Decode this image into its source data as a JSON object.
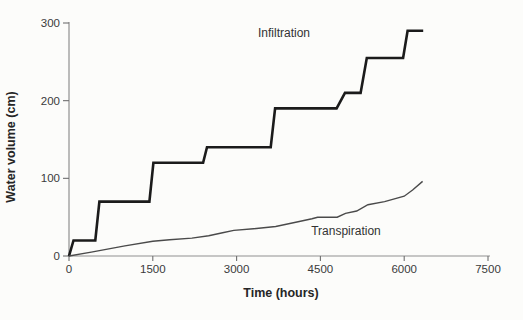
{
  "chart_data": {
    "type": "line",
    "title": "",
    "xlabel": "Time (hours)",
    "ylabel": "Water volume (cm)",
    "xlim": [
      0,
      7500
    ],
    "ylim": [
      0,
      300
    ],
    "x_ticks": [
      0,
      1500,
      3000,
      4500,
      6000,
      7500
    ],
    "y_ticks": [
      0,
      100,
      200,
      300
    ],
    "grid": false,
    "legend": "inline-annotations",
    "axis_color": "#8f8f8f",
    "tick_color": "#6f6f6f",
    "series": [
      {
        "name": "Infiltration",
        "style": "step",
        "color": "#1b1b1b",
        "stroke_width": 2.6,
        "points": [
          [
            0,
            0
          ],
          [
            80,
            20
          ],
          [
            470,
            20
          ],
          [
            545,
            70
          ],
          [
            1440,
            70
          ],
          [
            1510,
            120
          ],
          [
            2400,
            120
          ],
          [
            2470,
            140
          ],
          [
            3610,
            140
          ],
          [
            3690,
            190
          ],
          [
            4790,
            190
          ],
          [
            4940,
            210
          ],
          [
            5220,
            210
          ],
          [
            5330,
            255
          ],
          [
            5980,
            255
          ],
          [
            6060,
            290
          ],
          [
            6340,
            290
          ]
        ]
      },
      {
        "name": "Transpiration",
        "style": "smooth",
        "color": "#4a4a4a",
        "stroke_width": 1.4,
        "points": [
          [
            0,
            0
          ],
          [
            400,
            5
          ],
          [
            1000,
            13
          ],
          [
            1500,
            19
          ],
          [
            1800,
            21
          ],
          [
            2200,
            23
          ],
          [
            2500,
            26
          ],
          [
            2750,
            30
          ],
          [
            2950,
            33
          ],
          [
            3300,
            35
          ],
          [
            3700,
            38
          ],
          [
            4100,
            44
          ],
          [
            4350,
            48
          ],
          [
            4450,
            50
          ],
          [
            4800,
            50
          ],
          [
            4950,
            55
          ],
          [
            5150,
            58
          ],
          [
            5350,
            66
          ],
          [
            5650,
            70
          ],
          [
            6000,
            77
          ],
          [
            6150,
            85
          ],
          [
            6330,
            96
          ]
        ]
      }
    ],
    "annotations": [
      {
        "text": "Infiltration",
        "x_hours": 3850,
        "y_cm": 287
      },
      {
        "text": "Transpiration",
        "x_hours": 4960,
        "y_cm": 26
      }
    ]
  }
}
